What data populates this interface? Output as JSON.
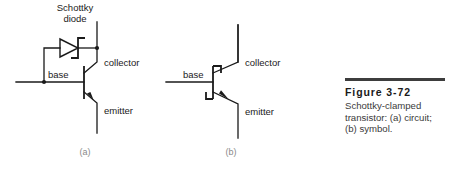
{
  "figure": {
    "number_label": "Figure 3-72",
    "caption_lines": [
      "Schottky-clamped",
      "transistor: (a) circuit;",
      "(b) symbol."
    ],
    "rule_color": "#3d3d3d"
  },
  "circuit_a": {
    "sub_label": "(a)",
    "diode_label_line1": "Schottky",
    "diode_label_line2": "diode",
    "base_label": "base",
    "collector_label": "collector",
    "emitter_label": "emitter",
    "device": "npn-bipolar-transistor-with-schottky-clamp-diode",
    "wire_color": "#1a1a1a"
  },
  "symbol_b": {
    "sub_label": "(b)",
    "base_label": "base",
    "collector_label": "collector",
    "emitter_label": "emitter",
    "device": "schottky-clamped-transistor-symbol",
    "wire_color": "#1a1a1a"
  }
}
